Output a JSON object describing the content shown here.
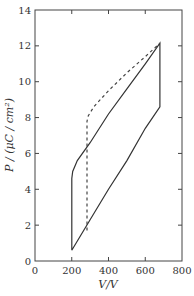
{
  "chart_data": {
    "type": "line",
    "title": "",
    "xlabel": "V / V",
    "ylabel": "P / (μC / cm²)",
    "xlim": [
      0,
      800
    ],
    "ylim": [
      0,
      14
    ],
    "xticks": [
      0,
      200,
      400,
      600,
      800
    ],
    "yticks": [
      0,
      2,
      4,
      6,
      8,
      10,
      12,
      14
    ],
    "grid": false,
    "legend": null,
    "series": [
      {
        "name": "hysteresis loop (solid)",
        "style": "solid",
        "x": [
          200,
          200,
          205,
          230,
          300,
          400,
          500,
          600,
          680,
          680,
          600,
          500,
          400,
          300,
          200
        ],
        "y": [
          0.6,
          4.6,
          5.0,
          5.6,
          6.6,
          8.2,
          9.6,
          11.0,
          12.15,
          8.6,
          7.4,
          5.6,
          4.0,
          2.3,
          0.6
        ]
      },
      {
        "name": "initial path (dashed)",
        "style": "dashed",
        "x": [
          283,
          283,
          290,
          320,
          400,
          500,
          600,
          680
        ],
        "y": [
          1.7,
          7.8,
          8.1,
          8.6,
          9.5,
          10.5,
          11.4,
          12.15
        ]
      }
    ]
  },
  "axes": {
    "x_ticks": [
      "0",
      "200",
      "400",
      "600",
      "800"
    ],
    "y_ticks": [
      "0",
      "2",
      "4",
      "6",
      "8",
      "10",
      "12",
      "14"
    ],
    "x_title": "V/V",
    "y_title": "P / (μC / cm²)"
  }
}
